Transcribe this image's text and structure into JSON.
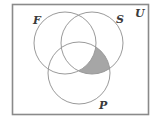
{
  "diagram": {
    "type": "venn",
    "universe": {
      "label": "U"
    },
    "sets": [
      {
        "id": "F",
        "label": "F"
      },
      {
        "id": "S",
        "label": "S"
      },
      {
        "id": "P",
        "label": "P"
      }
    ],
    "shaded_region": "(S ∩ P) − F",
    "colors": {
      "border": "#8a8a8a",
      "circle": "#9a9a9a",
      "shade": "#a6a6a6",
      "background": "#ffffff",
      "text": "#3a3a3a"
    }
  }
}
